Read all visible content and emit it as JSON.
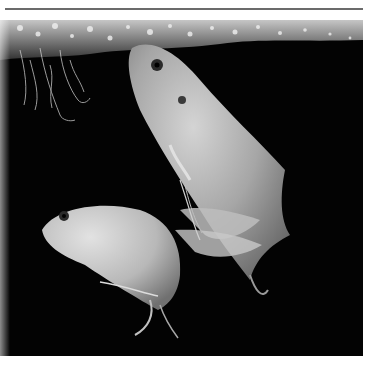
{
  "image": {
    "alt": "Two pale gourami fish swimming beneath a bubble nest in dark water, black and white photograph",
    "style": "monochrome",
    "colors": {
      "background": "#030303",
      "frame": "#ffffff",
      "rule": "#6b6b6b",
      "fish_light": "#d8d8d8",
      "fish_mid": "#9a9a9a",
      "bubbles": "#e6e6e6"
    },
    "subjects": [
      {
        "name": "upper-fish",
        "description": "large gourami angled head-up with long ventral filament fins"
      },
      {
        "name": "lower-fish",
        "description": "smaller gourami facing left, lower left"
      },
      {
        "name": "bubble-nest",
        "description": "band of foam bubbles along the surface at top"
      },
      {
        "name": "plant-roots",
        "description": "thin trailing roots hanging at upper left"
      }
    ]
  }
}
